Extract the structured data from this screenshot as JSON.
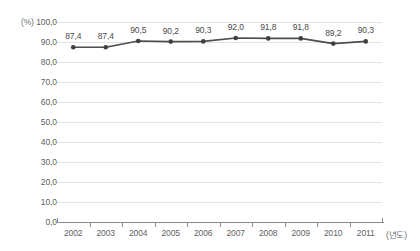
{
  "chart_data": {
    "type": "line",
    "title": "",
    "subtitle": "",
    "xlabel": "(년도)",
    "ylabel": "(%)",
    "categories": [
      "2002",
      "2003",
      "2004",
      "2005",
      "2006",
      "2007",
      "2008",
      "2009",
      "2010",
      "2011"
    ],
    "values": [
      87.4,
      87.4,
      90.5,
      90.2,
      90.3,
      92.0,
      91.8,
      91.8,
      89.2,
      90.3
    ],
    "point_labels": [
      "87,4",
      "87,4",
      "90,5",
      "90,2",
      "90,3",
      "92,0",
      "91,8",
      "91,8",
      "89,2",
      "90,3"
    ],
    "ylim": [
      0,
      100
    ],
    "ytick_values": [
      0,
      10,
      20,
      30,
      40,
      50,
      60,
      70,
      80,
      90,
      100
    ],
    "ytick_labels": [
      "0,0",
      "10,0",
      "20,0",
      "30,0",
      "40,0",
      "50,0",
      "60,0",
      "70,0",
      "80,0",
      "90,0",
      "100,0"
    ],
    "grid": true,
    "grid_axis": "y",
    "legend": null,
    "legend_position": "none",
    "decimal_separator": ",",
    "series": [
      {
        "name": "",
        "values": [
          87.4,
          87.4,
          90.5,
          90.2,
          90.3,
          92.0,
          91.8,
          91.8,
          89.2,
          90.3
        ],
        "marker": "circle",
        "show_data_labels": true
      }
    ],
    "colors": {
      "line": "#4d4d4d",
      "marker": "#3f3f3f",
      "grid": "#e3e3e3",
      "axis": "#8a8a8a",
      "tick_text": "#5f5f5f",
      "label_text": "#4a4a4a",
      "background": "#ffffff"
    }
  }
}
